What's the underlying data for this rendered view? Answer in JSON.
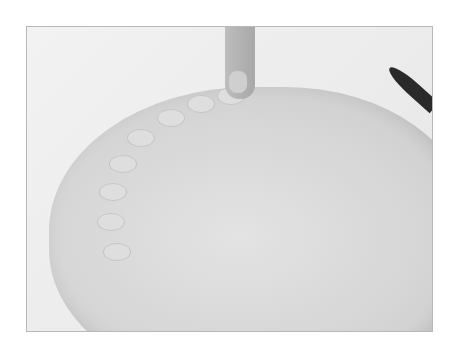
{
  "image": {
    "description": "Black-and-white photo of a hand crimping the edge of a rolled pie crust dough with a finger; a knife blade is visible at the right edge",
    "subjects": [
      "pie-crust-dough",
      "crimped-edge",
      "finger",
      "knife-blade"
    ],
    "colors": {
      "background": "#ffffff",
      "frame_border": "#b8b8b8",
      "dough": "#d6d6d6",
      "knife": "#2a2a2a"
    }
  }
}
